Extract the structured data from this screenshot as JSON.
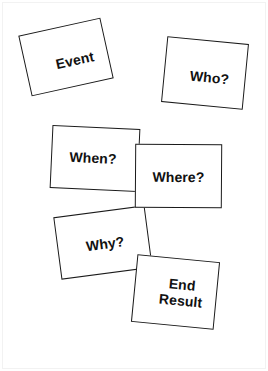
{
  "diagram": {
    "background_color": "#ffffff",
    "card_border_color": "#1a1a1a",
    "text_color": "#111111",
    "cards": [
      {
        "id": "event",
        "label": "Event",
        "rotation_deg": -12.5
      },
      {
        "id": "who",
        "label": "Who?",
        "rotation_deg": 5.5
      },
      {
        "id": "when",
        "label": "When?",
        "rotation_deg": 2.6
      },
      {
        "id": "where",
        "label": "Where?",
        "rotation_deg": 0.4
      },
      {
        "id": "why",
        "label": "Why?",
        "rotation_deg": -7.5
      },
      {
        "id": "end-result",
        "label": "End\nResult",
        "rotation_deg": 5.5
      }
    ]
  }
}
